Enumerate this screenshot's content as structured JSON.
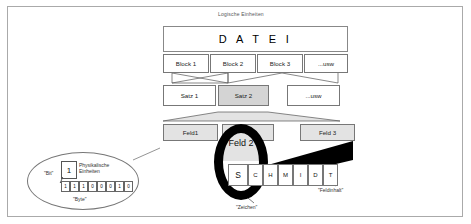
{
  "diagram": {
    "top_label": "Logische Einheiten",
    "file_box": "D A T E I",
    "blocks": [
      "Block 1",
      "Block 2",
      "Block 3",
      "...usw"
    ],
    "records": [
      "Satz 1",
      "Satz 2",
      "...usw"
    ],
    "fields": [
      "Feld1",
      "Feld 2",
      "Feld 3"
    ],
    "field_content_chars": [
      "S",
      "C",
      "H",
      "M",
      "I",
      "D",
      "T"
    ],
    "physical": {
      "title_line1": "Physikalische",
      "title_line2": "Einheiten",
      "bit_card_value": "1",
      "bit_label": "\"Bit\"",
      "byte_label": "\"Byte\"",
      "bits": [
        "1",
        "1",
        "1",
        "0",
        "0",
        "0",
        "1",
        "0"
      ]
    },
    "callouts": {
      "zeichen": "\"Zeichen\"",
      "feldinhalt": "\"Feldinhalt\""
    },
    "colors": {
      "shade_gray": "#d4d4d4",
      "light_gray": "#e3e3e3",
      "stroke": "#777777",
      "black": "#000000",
      "frame": "#aaaaaa"
    }
  }
}
